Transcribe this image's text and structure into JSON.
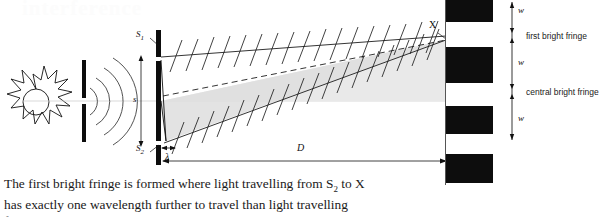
{
  "page": {
    "width": 607,
    "height": 217,
    "background": "#ffffff",
    "ink": "#111111",
    "fringe_color": "#0d0d0d",
    "beam_fill": "#e6e6e6",
    "watermark_text": "interference"
  },
  "diagram": {
    "labels": {
      "slit_top": "S",
      "slit_top_sub": "1",
      "slit_bottom": "S",
      "slit_bottom_sub": "2",
      "slit_separation": "s",
      "path_difference": "λ",
      "screen_distance": "D",
      "point_x": "X"
    },
    "sun": {
      "name": "sun-source",
      "rays": 12
    },
    "single_slit": {
      "name": "single-slit-barrier"
    },
    "wavefronts": {
      "name": "circular-wavefronts",
      "count": 4
    },
    "double_slit": {
      "name": "double-slit-barrier"
    },
    "ray_s1": {
      "name": "ray-from-s1-to-x",
      "wave_ticks": 18
    },
    "ray_s2": {
      "name": "ray-from-s2-to-x",
      "wave_ticks": 19
    }
  },
  "fringes": {
    "screen_label": "observation-screen",
    "bars": [
      {
        "top": 0,
        "height": 22
      },
      {
        "top": 47,
        "height": 36
      },
      {
        "top": 106,
        "height": 28
      },
      {
        "top": 154,
        "height": 29
      }
    ],
    "dimension_labels": [
      {
        "text": "w",
        "top": 5
      },
      {
        "text": "w",
        "top": 57
      },
      {
        "text": "w",
        "top": 113
      }
    ],
    "annotations": [
      {
        "text": "first bright fringe",
        "top": 33
      },
      {
        "text": "central bright fringe",
        "top": 89
      }
    ]
  },
  "paragraph": {
    "line1": "The first bright fringe is formed where light travelling from S",
    "line1_sub": "2",
    "line1_end": " to X",
    "line2": "has exactly one wavelength further to travel than light travelling",
    "line3_clipped": "from S"
  }
}
